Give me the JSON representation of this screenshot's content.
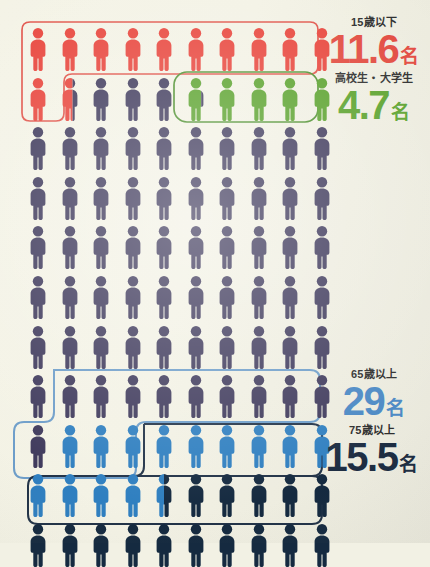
{
  "meta": {
    "unit_suffix": "名",
    "total_figures": 100,
    "columns": 10,
    "rows": 11,
    "footer_note": ""
  },
  "colors": {
    "background": "#f2f1e4",
    "red": "#e8453c",
    "green": "#5aa22c",
    "purple": "#3f3a5c",
    "blue": "#2f7fc0",
    "navy": "#152a40",
    "outline_red": "#e1554b",
    "outline_green": "#4f9130",
    "outline_blue": "#6d9dc9",
    "outline_navy": "#223348"
  },
  "legend": [
    {
      "id": "under15",
      "caption": "15歳以下",
      "value": "11.6",
      "unit": "名",
      "color": "#e24a3f",
      "color_key": "red"
    },
    {
      "id": "students",
      "caption": "高校生・大学生",
      "value": "4.7",
      "unit": "名",
      "color": "#5aa22c",
      "color_key": "green"
    },
    {
      "id": "over65",
      "caption": "65歳以上",
      "value": "29",
      "unit": "名",
      "color": "#4a88c4",
      "color_key": "blue"
    },
    {
      "id": "over75",
      "caption": "75歳以上",
      "value": "15.5",
      "unit": "名",
      "color": "#1d2d42",
      "color_key": "navy"
    }
  ],
  "chart_data": {
    "type": "pictogram",
    "unit": "名",
    "figures_total": 100,
    "columns": 10,
    "rows": 11,
    "categories": [
      "15歳以下",
      "高校生・大学生",
      "65歳以上",
      "75歳以上"
    ],
    "values": [
      11.6,
      4.7,
      29,
      15.5
    ],
    "series": [
      {
        "name": "15歳以下",
        "value": 11.6,
        "color": "#e8453c"
      },
      {
        "name": "高校生・大学生",
        "value": 4.7,
        "color": "#5aa22c"
      },
      {
        "name": "65歳以上",
        "value": 29,
        "color": "#2f7fc0"
      },
      {
        "name": "75歳以上",
        "value": 15.5,
        "color": "#152a40"
      }
    ],
    "rows_layout": [
      {
        "row": 1,
        "cells": [
          {
            "fill": "red",
            "frac": 1
          },
          {
            "fill": "red",
            "frac": 1
          },
          {
            "fill": "red",
            "frac": 1
          },
          {
            "fill": "red",
            "frac": 1
          },
          {
            "fill": "red",
            "frac": 1
          },
          {
            "fill": "red",
            "frac": 1
          },
          {
            "fill": "red",
            "frac": 1
          },
          {
            "fill": "red",
            "frac": 1
          },
          {
            "fill": "red",
            "frac": 1
          },
          {
            "fill": "red",
            "frac": 1
          }
        ]
      },
      {
        "row": 2,
        "cells": [
          {
            "fill": "red",
            "frac": 1
          },
          {
            "fill": "red",
            "frac": 0.6,
            "rest": "purple"
          },
          {
            "fill": "purple",
            "frac": 1
          },
          {
            "fill": "purple",
            "frac": 1
          },
          {
            "fill": "purple",
            "frac": 1
          },
          {
            "fill": "green",
            "frac": 0.7,
            "rest": "purple"
          },
          {
            "fill": "green",
            "frac": 1
          },
          {
            "fill": "green",
            "frac": 1
          },
          {
            "fill": "green",
            "frac": 1
          },
          {
            "fill": "green",
            "frac": 1
          }
        ]
      },
      {
        "row": 3,
        "fill": "purple",
        "count": 10
      },
      {
        "row": 4,
        "fill": "purple",
        "count": 10
      },
      {
        "row": 5,
        "fill": "purple",
        "count": 10
      },
      {
        "row": 6,
        "fill": "purple",
        "count": 10
      },
      {
        "row": 7,
        "fill": "purple",
        "count": 10
      },
      {
        "row": 8,
        "fill": "purple",
        "count": 10
      },
      {
        "row": 9,
        "cells": [
          {
            "fill": "purple",
            "frac": 1
          },
          {
            "fill": "blue",
            "frac": 1
          },
          {
            "fill": "blue",
            "frac": 1
          },
          {
            "fill": "blue",
            "frac": 1
          },
          {
            "fill": "blue",
            "frac": 1
          },
          {
            "fill": "blue",
            "frac": 1
          },
          {
            "fill": "blue",
            "frac": 1
          },
          {
            "fill": "blue",
            "frac": 1
          },
          {
            "fill": "blue",
            "frac": 1
          },
          {
            "fill": "blue",
            "frac": 1
          }
        ]
      },
      {
        "row": 10,
        "cells": [
          {
            "fill": "blue",
            "frac": 1
          },
          {
            "fill": "blue",
            "frac": 1
          },
          {
            "fill": "blue",
            "frac": 1
          },
          {
            "fill": "blue",
            "frac": 1
          },
          {
            "fill": "blue",
            "frac": 0.5,
            "rest": "navy"
          },
          {
            "fill": "navy",
            "frac": 1
          },
          {
            "fill": "navy",
            "frac": 1
          },
          {
            "fill": "navy",
            "frac": 1
          },
          {
            "fill": "navy",
            "frac": 1
          },
          {
            "fill": "navy",
            "frac": 1
          }
        ]
      },
      {
        "row": 11,
        "fill": "navy",
        "count": 10
      }
    ]
  }
}
